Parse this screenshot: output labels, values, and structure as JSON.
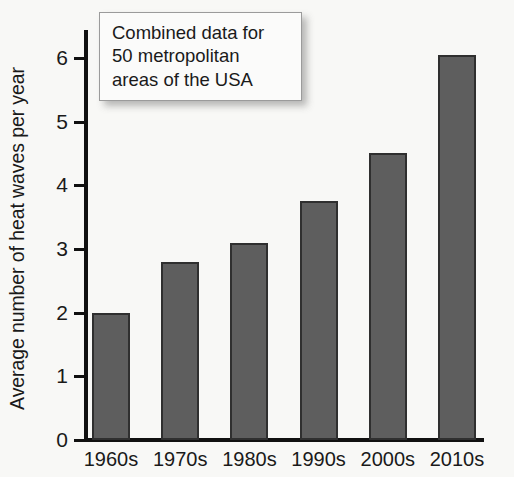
{
  "chart_data": {
    "type": "bar",
    "title": "",
    "subtitle": "",
    "xlabel": "",
    "ylabel": "Average number of heat waves per year",
    "categories": [
      "1960s",
      "1970s",
      "1980s",
      "1990s",
      "2000s",
      "2010s"
    ],
    "values": [
      2.0,
      2.8,
      3.1,
      3.75,
      4.5,
      6.05
    ],
    "ylim": [
      0,
      6.6
    ],
    "ytick_labels": [
      "0",
      "1",
      "2",
      "3",
      "4",
      "5",
      "6"
    ],
    "ytick_values": [
      0,
      1,
      2,
      3,
      4,
      5,
      6
    ],
    "grid": false,
    "legend": null,
    "bar_color": "#5e5e5e",
    "bar_edge_color": "#2f2f2f",
    "background_color": "#f8f8f6",
    "axis_color": "#111111",
    "annotations": [
      {
        "name": "combined-data-note",
        "lines": [
          "Combined data for",
          "50 metropolitan",
          "areas of the USA"
        ]
      }
    ]
  }
}
